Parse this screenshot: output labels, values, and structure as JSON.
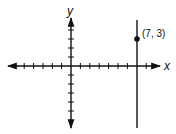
{
  "diagram": {
    "type": "coordinate-plane",
    "x_axis_label": "x",
    "y_axis_label": "y",
    "x_ticks": [
      -5,
      -4,
      -3,
      -2,
      -1,
      1,
      2,
      3,
      4,
      5,
      6,
      7,
      8
    ],
    "y_ticks": [
      3,
      2,
      1,
      -1,
      -2,
      -3,
      -4,
      -5
    ],
    "vertical_line": {
      "x": 7,
      "equation": "x = 7"
    },
    "point": {
      "x": 7,
      "y": 3,
      "label": "(7, 3)"
    },
    "colors": {
      "stroke": "#111111",
      "background": "#ffffff"
    }
  }
}
